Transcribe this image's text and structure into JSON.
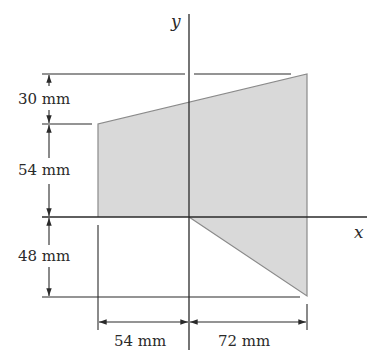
{
  "figure": {
    "type": "composite-area-section",
    "axes": {
      "x_label": "x",
      "y_label": "y"
    },
    "dimensions": {
      "top_offset": "30 mm",
      "upper_left_height": "54 mm",
      "lower_height": "48 mm",
      "left_width": "54 mm",
      "right_width": "72 mm"
    },
    "colors": {
      "shape_fill": "#d9d9d9",
      "shape_edge": "#8a8a8a",
      "lines": "#2a2a2a",
      "background": "#ffffff"
    }
  }
}
